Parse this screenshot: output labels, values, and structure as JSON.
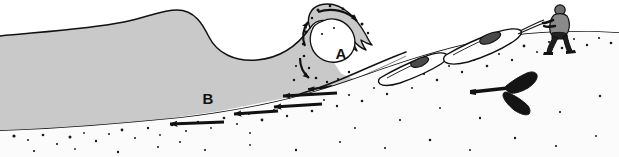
{
  "figure": {
    "width": 619,
    "height": 157,
    "background_color": "#ffffff",
    "ink_color": "#111111",
    "water_fill_color": "#c9c9c9",
    "sand_fill_color": "#fbfbfb",
    "grain_color": "#1a1a1a"
  },
  "labels": {
    "a": "A",
    "b": "B"
  },
  "annotations": {
    "a_meaning": "breaking wave curl",
    "b_meaning": "undertow / backwash flow seaward along the bed"
  },
  "scene": {
    "water_label": "sea water",
    "seabed_label": "sloping sandy seabed",
    "beach_label": "beach face",
    "swell_label": "incoming swell crest",
    "trough_label": "wave trough",
    "breaker_label": "plunging breaker",
    "spray_label": "spray droplets",
    "person_label": "person dragging kayak",
    "kayak_upper_label": "kayak being dragged",
    "kayak_lower_label": "kayak at waterline",
    "paddle_label": "paddle on sand"
  },
  "flow_arrows": {
    "undertow": [
      {
        "name": "undertow-arrow-1",
        "x1": 224,
        "y1": 122,
        "x2": 168,
        "y2": 124
      },
      {
        "name": "undertow-arrow-2",
        "x1": 278,
        "y1": 111,
        "x2": 232,
        "y2": 114
      },
      {
        "name": "undertow-arrow-3",
        "x1": 322,
        "y1": 104,
        "x2": 272,
        "y2": 107
      },
      {
        "name": "undertow-arrow-4",
        "x1": 337,
        "y1": 93,
        "x2": 281,
        "y2": 95
      }
    ],
    "curl": [
      {
        "name": "curl-arrow-top",
        "desc": "arrow along the curling lip pointing shoreward"
      },
      {
        "name": "curl-arrow-face",
        "desc": "arrow up the wave face"
      },
      {
        "name": "curl-arrow-back",
        "desc": "arrow down the back of the wave"
      },
      {
        "name": "curl-arrow-base",
        "desc": "arrow along the wave base"
      }
    ]
  }
}
